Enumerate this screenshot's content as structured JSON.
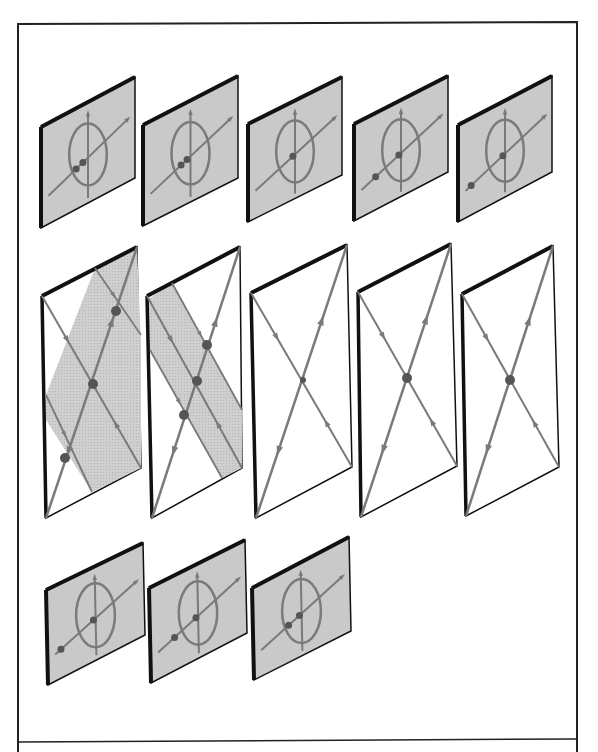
{
  "figure": {
    "width": 598,
    "height": 752,
    "colors": {
      "frame": "#222222",
      "panel_edge": "#111111",
      "panel_fill_gray": "#c9c9c9",
      "band_fill": "#cfcfcf",
      "curve": "#7a7a7a",
      "fixed_point": "#555555",
      "background": "#ffffff"
    },
    "frame": {
      "x1": 18,
      "y1": 24,
      "x2": 577,
      "y2": 752,
      "divider_y": 742
    },
    "small_panels": [
      {
        "id": "top-1",
        "tl": [
          41,
          127
        ],
        "tr": [
          135,
          77
        ],
        "br": [
          135,
          178
        ],
        "bl": [
          41,
          228
        ],
        "points": [
          [
            -0.28,
            0.1
          ],
          [
            -0.12,
            0.05
          ]
        ]
      },
      {
        "id": "top-2",
        "tl": [
          143,
          125
        ],
        "tr": [
          238,
          76
        ],
        "br": [
          238,
          178
        ],
        "bl": [
          143,
          226
        ],
        "points": [
          [
            -0.22,
            0.08
          ],
          [
            -0.08,
            0.03
          ]
        ]
      },
      {
        "id": "top-3",
        "tl": [
          248,
          124
        ],
        "tr": [
          342,
          77
        ],
        "br": [
          342,
          175
        ],
        "bl": [
          248,
          222
        ],
        "points": [
          [
            -0.05,
            0.02
          ]
        ]
      },
      {
        "id": "top-4",
        "tl": [
          354,
          124
        ],
        "tr": [
          448,
          76
        ],
        "br": [
          448,
          172
        ],
        "bl": [
          354,
          221
        ],
        "points": [
          [
            -0.6,
            0.22
          ],
          [
            -0.05,
            0.02
          ]
        ]
      },
      {
        "id": "top-5",
        "tl": [
          458,
          125
        ],
        "tr": [
          552,
          76
        ],
        "br": [
          552,
          172
        ],
        "bl": [
          458,
          222
        ],
        "points": [
          [
            -0.8,
            0.3
          ],
          [
            -0.05,
            0.02
          ]
        ]
      },
      {
        "id": "bottom-1",
        "tl": [
          46,
          590
        ],
        "tr": [
          143,
          543
        ],
        "br": [
          145,
          635
        ],
        "bl": [
          48,
          685
        ],
        "points": [
          [
            -0.8,
            0.3
          ],
          [
            -0.05,
            0.02
          ]
        ]
      },
      {
        "id": "bottom-2",
        "tl": [
          149,
          588
        ],
        "tr": [
          245,
          540
        ],
        "br": [
          247,
          633
        ],
        "bl": [
          151,
          683
        ],
        "points": [
          [
            -0.55,
            0.2
          ],
          [
            -0.05,
            0.02
          ]
        ]
      },
      {
        "id": "bottom-3",
        "tl": [
          252,
          588
        ],
        "tr": [
          349,
          537
        ],
        "br": [
          351,
          631
        ],
        "bl": [
          254,
          680
        ],
        "points": [
          [
            -0.3,
            0.11
          ],
          [
            -0.05,
            0.02
          ]
        ]
      }
    ],
    "tall_panels": [
      {
        "id": "middle-1",
        "tl": [
          42,
          296
        ],
        "tr": [
          137,
          247
        ],
        "br": [
          141,
          468
        ],
        "bl": [
          46,
          518
        ],
        "center": [
          93,
          384
        ],
        "band": [
          [
            95,
            268
          ],
          [
            137,
            247
          ],
          [
            141,
            345
          ],
          [
            141,
            468
          ],
          [
            92,
            492
          ],
          [
            46,
            420
          ],
          [
            46,
            395
          ]
        ],
        "extra_lines": [
          [
            [
              95,
              268
            ],
            [
              141,
              335
            ]
          ],
          [
            [
              46,
              395
            ],
            [
              92,
              492
            ]
          ]
        ],
        "fixed_points": [
          [
            116,
            311
          ],
          [
            93,
            384
          ],
          [
            65,
            458
          ]
        ]
      },
      {
        "id": "middle-2",
        "tl": [
          147,
          296
        ],
        "tr": [
          240,
          247
        ],
        "br": [
          242,
          468
        ],
        "bl": [
          152,
          518
        ],
        "center": [
          197,
          381
        ],
        "band": [
          [
            147,
            300
          ],
          [
            172,
            283
          ],
          [
            242,
            410
          ],
          [
            242,
            468
          ],
          [
            222,
            478
          ],
          [
            150,
            350
          ]
        ],
        "extra_lines": [
          [
            [
              172,
              283
            ],
            [
              242,
              410
            ]
          ],
          [
            [
              150,
              350
            ],
            [
              222,
              478
            ]
          ]
        ],
        "fixed_points": [
          [
            207,
            345
          ],
          [
            197,
            381
          ],
          [
            184,
            415
          ]
        ]
      },
      {
        "id": "middle-3",
        "tl": [
          251,
          293
        ],
        "tr": [
          347,
          245
        ],
        "br": [
          352,
          467
        ],
        "bl": [
          256,
          518
        ],
        "center": [
          303,
          380
        ],
        "band": null,
        "extra_lines": [],
        "fixed_points": [
          [
            303,
            380
          ]
        ],
        "small_dot": true
      },
      {
        "id": "middle-4",
        "tl": [
          358,
          292
        ],
        "tr": [
          451,
          244
        ],
        "br": [
          457,
          466
        ],
        "bl": [
          361,
          517
        ],
        "center": [
          407,
          378
        ],
        "band": null,
        "extra_lines": [],
        "fixed_points": [
          [
            407,
            378
          ]
        ]
      },
      {
        "id": "middle-5",
        "tl": [
          462,
          294
        ],
        "tr": [
          553,
          246
        ],
        "br": [
          559,
          467
        ],
        "bl": [
          466,
          516
        ],
        "center": [
          510,
          380
        ],
        "band": null,
        "extra_lines": [],
        "fixed_points": [
          [
            510,
            380
          ]
        ]
      }
    ]
  }
}
